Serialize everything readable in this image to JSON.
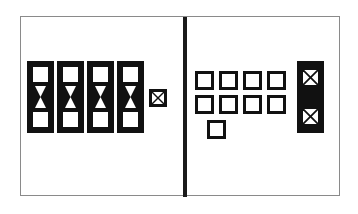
{
  "figure": {
    "title": "",
    "frame": {
      "x": 20,
      "y": 16,
      "width": 320,
      "height": 180,
      "border_color": "#8a8a8a"
    },
    "divider": {
      "x": 162,
      "width": 4,
      "color": "#1a1a1a"
    },
    "colors": {
      "ink": "#111111",
      "paper": "#ffffff",
      "frame": "#8a8a8a",
      "divider": "#1a1a1a"
    }
  },
  "left_panel": {
    "label": "",
    "bracket_groups": [
      {
        "id": "group-1",
        "x": 6,
        "y": 44,
        "width": 27,
        "height": 72,
        "slots": 2,
        "connector": "hourglass"
      },
      {
        "id": "group-2",
        "x": 36,
        "y": 44,
        "width": 27,
        "height": 72,
        "slots": 2,
        "connector": "hourglass"
      },
      {
        "id": "group-3",
        "x": 66,
        "y": 44,
        "width": 27,
        "height": 72,
        "slots": 2,
        "connector": "hourglass"
      },
      {
        "id": "group-4",
        "x": 96,
        "y": 44,
        "width": 27,
        "height": 72,
        "slots": 2,
        "connector": "hourglass"
      }
    ],
    "standalone_nodes": [
      {
        "id": "x-node-left",
        "x": 128,
        "y": 72,
        "size": 18,
        "mark": "cross"
      }
    ]
  },
  "right_panel": {
    "label": "",
    "grid": {
      "columns": 4,
      "rows": 2,
      "cell_size": 19,
      "gap": 5,
      "origin_x": 8,
      "origin_y": 54,
      "mark": "none"
    },
    "extra_nodes": [
      {
        "id": "grid-extra-node",
        "x": 20,
        "y": 106,
        "size": 19,
        "mark": "none"
      }
    ],
    "bracket_groups": [
      {
        "id": "group-5",
        "x": 110,
        "y": 44,
        "width": 27,
        "height": 72,
        "slots": 2,
        "connector": "none",
        "mark": "cross"
      }
    ]
  },
  "legend": {
    "entries": []
  }
}
